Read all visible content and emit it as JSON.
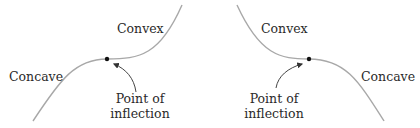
{
  "diagram": {
    "colors": {
      "curve": "#a8a8a8",
      "dot": "#111111",
      "arrow": "#444444",
      "text": "#2a2a2a"
    },
    "left_panel": {
      "convex_label": "Convex",
      "concave_label": "Concave",
      "inflection_label_line1": "Point of",
      "inflection_label_line2": "inflection"
    },
    "right_panel": {
      "convex_label": "Convex",
      "concave_label": "Concave",
      "inflection_label_line1": "Point of",
      "inflection_label_line2": "inflection"
    }
  }
}
